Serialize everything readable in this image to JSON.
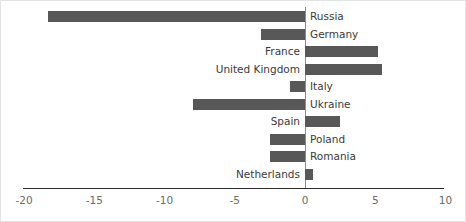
{
  "chart_data": {
    "type": "bar",
    "orientation": "horizontal",
    "title": "",
    "subtitle": "",
    "xlabel": "",
    "ylabel": "",
    "xlim": [
      -20,
      10
    ],
    "xticks": [
      -20,
      -15,
      -10,
      -5,
      0,
      5,
      10
    ],
    "xtick_labels": [
      "-20",
      "-15",
      "-10",
      "-5",
      "0",
      "5",
      "10"
    ],
    "grid": false,
    "legend": null,
    "bar_color": "#585858",
    "axis_color": "#2b2b2b",
    "zero_line_color": "#8c8c8c",
    "categories": [
      "Russia",
      "Germany",
      "France",
      "United Kingdom",
      "Italy",
      "Ukraine",
      "Spain",
      "Poland",
      "Romania",
      "Netherlands"
    ],
    "values": [
      -18.3,
      -3.1,
      5.2,
      5.5,
      -1.1,
      -8.0,
      2.5,
      -2.5,
      -2.5,
      0.6
    ],
    "labels": [
      {
        "name": "Russia",
        "value": -18.3,
        "side": "right"
      },
      {
        "name": "Germany",
        "value": -3.1,
        "side": "right"
      },
      {
        "name": "France",
        "value": 5.2,
        "side": "left"
      },
      {
        "name": "United Kingdom",
        "value": 5.5,
        "side": "left"
      },
      {
        "name": "Italy",
        "value": -1.1,
        "side": "right"
      },
      {
        "name": "Ukraine",
        "value": -8.0,
        "side": "right"
      },
      {
        "name": "Spain",
        "value": 2.5,
        "side": "left"
      },
      {
        "name": "Poland",
        "value": -2.5,
        "side": "right"
      },
      {
        "name": "Romania",
        "value": -2.5,
        "side": "right"
      },
      {
        "name": "Netherlands",
        "value": 0.6,
        "side": "left"
      }
    ]
  },
  "layout": {
    "zero_x_px": 304,
    "px_per_unit": 14.05,
    "first_bar_top_px": 10,
    "bar_pitch_px": 17.5,
    "bar_height_px": 11
  }
}
